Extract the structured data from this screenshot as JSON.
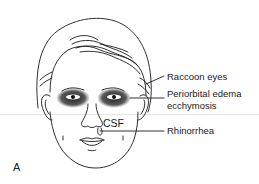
{
  "figure": {
    "panel_label": "A",
    "annotations": [
      {
        "id": "raccoon",
        "text": "Raccoon eyes"
      },
      {
        "id": "periorbital1",
        "text": "Periorbital edema"
      },
      {
        "id": "periorbital2",
        "text": "ecchymosis"
      },
      {
        "id": "csf",
        "text": "CSF"
      },
      {
        "id": "rhinorrhea",
        "text": "Rhinorrhea"
      }
    ],
    "colors": {
      "ink": "#1a1a1a",
      "bruise": "#111111",
      "background": "#ffffff"
    }
  }
}
